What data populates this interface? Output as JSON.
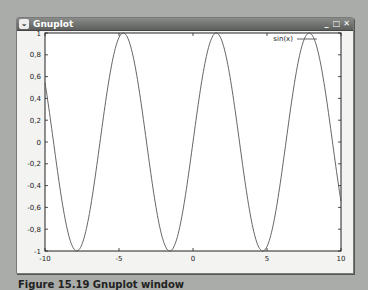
{
  "window": {
    "title": "Gnuplot",
    "buttons": {
      "minimize": "_",
      "maximize": "□",
      "close": "✕"
    }
  },
  "chart_data": {
    "type": "line",
    "title": "",
    "xlabel": "",
    "ylabel": "",
    "xlim": [
      -10,
      10
    ],
    "ylim": [
      -1,
      1
    ],
    "x_ticks": [
      "-10",
      "-5",
      "0",
      "5",
      "10"
    ],
    "y_ticks": [
      "1",
      "0.8",
      "0.6",
      "0.4",
      "0.2",
      "0",
      "-0.2",
      "-0.4",
      "-0.6",
      "-0.8",
      "-1"
    ],
    "grid": false,
    "legend_position": "top-right",
    "series": [
      {
        "name": "sin(x)",
        "function": "sin(x)",
        "color": "#555555"
      }
    ]
  },
  "legend": {
    "label": "sin(x)"
  },
  "caption": "Figure 15.19 Gnuplot window"
}
